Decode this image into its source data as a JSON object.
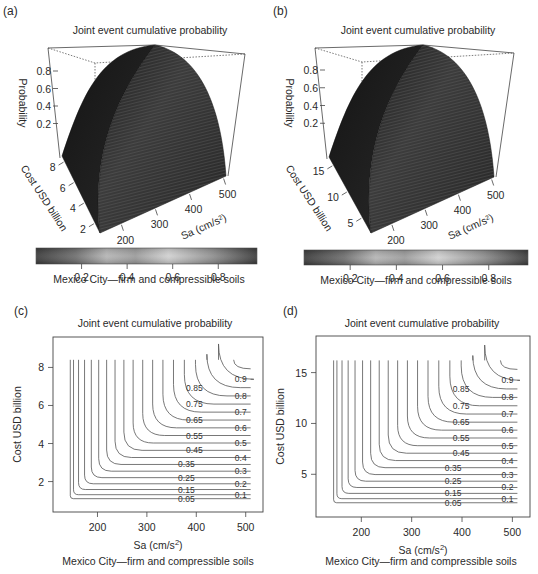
{
  "figure": {
    "caption": "Mexico City—firm and compressible soils",
    "panels": [
      {
        "label": "(a)",
        "title": "Joint event cumulative probability",
        "kind": "surface"
      },
      {
        "label": "(b)",
        "title": "Joint event cumulative probability",
        "kind": "surface"
      },
      {
        "label": "(c)",
        "title": "Joint event cumulative probability",
        "kind": "contour"
      },
      {
        "label": "(d)",
        "title": "Joint event cumulative probability",
        "kind": "contour"
      }
    ]
  },
  "chart_data": [
    {
      "panel": "(a)",
      "type": "surface",
      "title": "Joint event cumulative probability",
      "xlabel": "Sa (cm/s²)",
      "ylabel": "Cost USD billion",
      "zlabel": "Probability",
      "x_ticks": [
        200,
        300,
        400,
        500
      ],
      "y_ticks": [
        2,
        4,
        6,
        8
      ],
      "z_ticks": [
        0.2,
        0.4,
        0.6,
        0.8
      ],
      "xlim": [
        140,
        510
      ],
      "ylim": [
        1,
        8.5
      ],
      "zlim": [
        0,
        0.97
      ],
      "colorbar": {
        "ticks": [
          0.2,
          0.4,
          0.6,
          0.8
        ],
        "range": [
          0,
          0.97
        ]
      },
      "caption": "Mexico City—firm and compressible soils"
    },
    {
      "panel": "(b)",
      "type": "surface",
      "title": "Joint event cumulative probability",
      "xlabel": "Sa (cm/s²)",
      "ylabel": "Cost USD billion",
      "zlabel": "Probability",
      "x_ticks": [
        200,
        300,
        400,
        500
      ],
      "y_ticks": [
        5,
        10,
        15
      ],
      "z_ticks": [
        0.2,
        0.4,
        0.6,
        0.8
      ],
      "xlim": [
        140,
        510
      ],
      "ylim": [
        2,
        16.5
      ],
      "zlim": [
        0,
        0.97
      ],
      "colorbar": {
        "ticks": [
          0.2,
          0.4,
          0.6,
          0.8
        ],
        "range": [
          0,
          0.97
        ]
      },
      "caption": "Mexico City—firm and compressible soils"
    },
    {
      "panel": "(c)",
      "type": "contour",
      "title": "Joint event cumulative probability",
      "xlabel": "Sa (cm/s²)",
      "ylabel": "Cost USD billion",
      "x_ticks": [
        200,
        300,
        400,
        500
      ],
      "y_ticks": [
        2,
        4,
        6,
        8
      ],
      "xlim": [
        110,
        535
      ],
      "ylim": [
        0.4,
        9.6
      ],
      "data_xlim": [
        140,
        510
      ],
      "data_ylim": [
        1.1,
        8.4
      ],
      "levels": [
        0.05,
        0.1,
        0.15,
        0.2,
        0.25,
        0.3,
        0.35,
        0.4,
        0.45,
        0.5,
        0.55,
        0.6,
        0.65,
        0.7,
        0.75,
        0.8,
        0.85,
        0.9
      ],
      "labeled_levels": [
        "0.05",
        "0.1",
        "0.15",
        "0.2",
        "0.25",
        "0.3",
        "0.35",
        "0.4",
        "0.45",
        "0.5",
        "0.55",
        "0.6",
        "0.65",
        "0.7",
        "0.75",
        "0.8",
        "0.85",
        "0.9"
      ],
      "caption": "Mexico City—firm and compressible soils"
    },
    {
      "panel": "(d)",
      "type": "contour",
      "title": "Joint event cumulative probability",
      "xlabel": "Sa (cm/s²)",
      "ylabel": "Cost USD billion",
      "x_ticks": [
        200,
        300,
        400,
        500
      ],
      "y_ticks": [
        5,
        10,
        15
      ],
      "xlim": [
        110,
        535
      ],
      "ylim": [
        0.8,
        18.6
      ],
      "data_xlim": [
        140,
        510
      ],
      "data_ylim": [
        2.2,
        16.2
      ],
      "levels": [
        0.05,
        0.1,
        0.15,
        0.2,
        0.25,
        0.3,
        0.35,
        0.4,
        0.45,
        0.5,
        0.55,
        0.6,
        0.65,
        0.7,
        0.75,
        0.8,
        0.85,
        0.9
      ],
      "labeled_levels": [
        "0.05",
        "0.1",
        "0.15",
        "0.2",
        "0.25",
        "0.3",
        "0.35",
        "0.4",
        "0.45",
        "0.5",
        "0.55",
        "0.6",
        "0.65",
        "0.7",
        "0.75",
        "0.8",
        "0.85",
        "0.9"
      ],
      "caption": "Mexico City—firm and compressible soils"
    }
  ],
  "colors": {
    "surface_dark": "#1a1a1a",
    "surface_mid": "#3a3a3a",
    "axis": "#444444",
    "contour_line": "#555555",
    "colorbar_stops": [
      "#3c3c3c",
      "#6a6a6a",
      "#b0b0b0",
      "#8c8c8c",
      "#c8c8c8",
      "#909090",
      "#3c3c3c"
    ]
  }
}
